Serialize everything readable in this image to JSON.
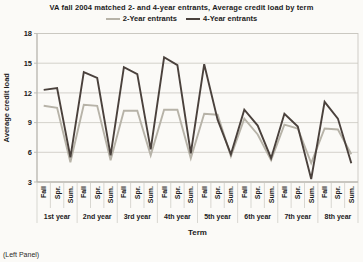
{
  "footer": "(Left Panel)",
  "chart_data": {
    "type": "line",
    "title": "VA fall 2004 matched 2- and 4-year entrants, Average credit load by term",
    "xlabel": "Term",
    "ylabel": "Average credit load",
    "ylim": [
      3,
      18
    ],
    "yticks": [
      3,
      6,
      9,
      12,
      15,
      18
    ],
    "grid": true,
    "legend_position": "top",
    "categories": [
      "Fall",
      "Spr.",
      "Sum.",
      "Fall",
      "Spr.",
      "Sum.",
      "Fall",
      "Spr.",
      "Sum.",
      "Fall",
      "Spr.",
      "Sum.",
      "Fall",
      "Spr.",
      "Sum.",
      "Fall",
      "Spr.",
      "Sum.",
      "Fall",
      "Spr.",
      "Sum.",
      "Fall",
      "Spr.",
      "Sum."
    ],
    "year_groups": [
      "1st year",
      "2nd year",
      "3rd year",
      "4th year",
      "5th year",
      "6th year",
      "7th year",
      "8th year"
    ],
    "series": [
      {
        "name": "2-Year entrants",
        "color": "#b7b3a8",
        "values": [
          10.7,
          10.5,
          5.0,
          10.8,
          10.7,
          5.2,
          10.2,
          10.2,
          5.7,
          10.3,
          10.3,
          5.4,
          9.9,
          9.8,
          5.6,
          9.4,
          7.8,
          5.2,
          8.8,
          8.4,
          4.9,
          8.4,
          8.3,
          5.8
        ]
      },
      {
        "name": "4-Year entrants",
        "color": "#4a413c",
        "values": [
          12.3,
          12.5,
          5.5,
          14.1,
          13.5,
          5.7,
          14.6,
          13.9,
          6.3,
          15.6,
          14.8,
          5.9,
          14.9,
          9.3,
          5.8,
          10.3,
          8.7,
          5.4,
          9.9,
          8.6,
          3.3,
          11.1,
          9.4,
          4.9
        ]
      }
    ]
  }
}
